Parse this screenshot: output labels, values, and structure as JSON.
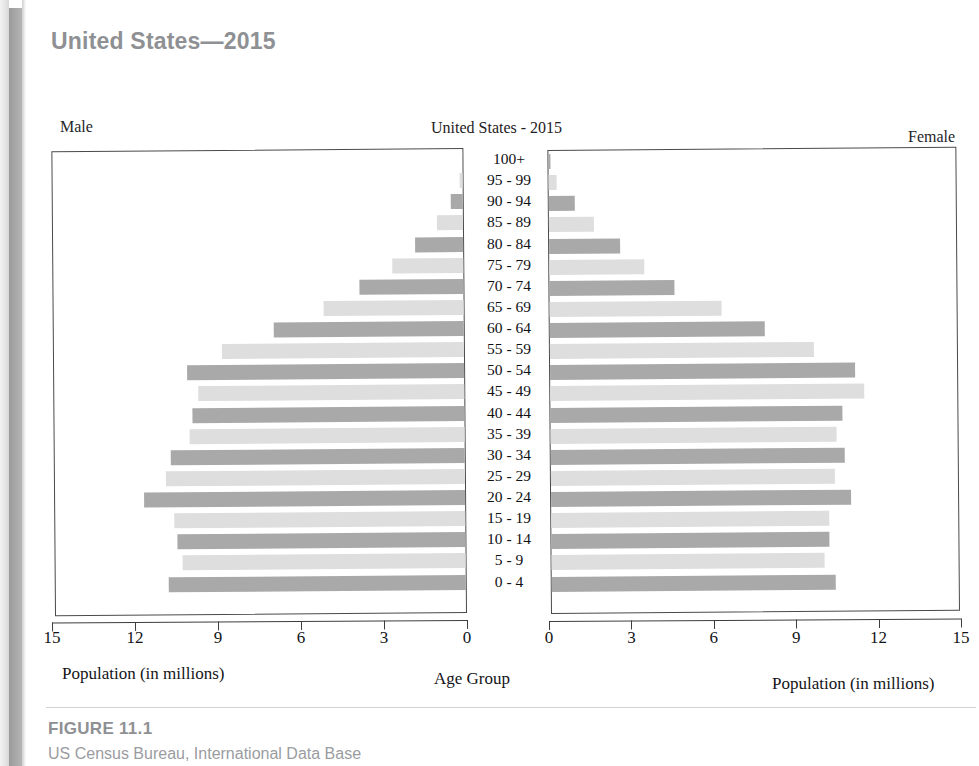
{
  "page": {
    "heading": "United States—2015"
  },
  "figure": {
    "male_label": "Male",
    "female_label": "Female",
    "chart_title": "United States - 2015",
    "left_axis_caption": "Population (in millions)",
    "center_axis_caption": "Age Group",
    "right_axis_caption": "Population (in millions)",
    "figure_number": "FIGURE 11.1",
    "source": "US Census Bureau, International Data Base"
  },
  "colors": {
    "bar_dark": "#a9a9a9",
    "bar_light": "#dedede",
    "heading": "#8e9093",
    "axis": "#3d3d3d",
    "text": "#131417"
  },
  "chart_data": {
    "type": "bar",
    "subtype": "population-pyramid",
    "title": "United States - 2015",
    "xlabel": "Population (in millions)",
    "ylabel": "Age Group",
    "xlim_left": [
      15,
      0
    ],
    "xlim_right": [
      0,
      15
    ],
    "xticks_left": [
      "15",
      "12",
      "9",
      "6",
      "3",
      "0"
    ],
    "xticks_right": [
      "0",
      "3",
      "6",
      "9",
      "12",
      "15"
    ],
    "grid": false,
    "legend": [
      "Male",
      "Female"
    ],
    "legend_position": "outside-top-corners",
    "categories": [
      "100+",
      "95 - 99",
      "90 - 94",
      "85 - 89",
      "80 - 84",
      "75 - 79",
      "70 - 74",
      "65 - 69",
      "60 - 64",
      "55 - 59",
      "50 - 54",
      "45 - 49",
      "40 - 44",
      "35 - 39",
      "30 - 34",
      "25 - 29",
      "20 - 24",
      "15 - 19",
      "10 - 14",
      "5 - 9",
      "0 - 4"
    ],
    "series": [
      {
        "name": "Male",
        "side": "left",
        "values": [
          0.01,
          0.12,
          0.45,
          0.95,
          1.75,
          2.6,
          3.8,
          5.1,
          6.9,
          8.8,
          10.1,
          9.7,
          9.9,
          10.0,
          10.7,
          10.9,
          11.7,
          10.6,
          10.5,
          10.3,
          10.8
        ]
      },
      {
        "name": "Female",
        "side": "right",
        "values": [
          0.06,
          0.3,
          0.95,
          1.65,
          2.6,
          3.5,
          4.6,
          6.3,
          7.9,
          9.7,
          11.2,
          11.5,
          10.7,
          10.5,
          10.8,
          10.4,
          11.0,
          10.2,
          10.2,
          10.0,
          10.4
        ]
      }
    ]
  }
}
